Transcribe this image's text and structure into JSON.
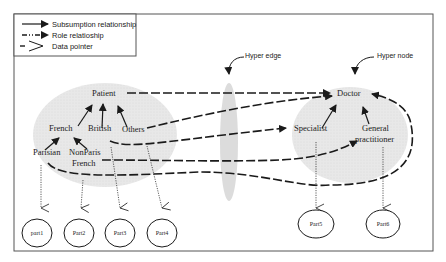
{
  "legend": {
    "items": [
      {
        "label": "Subsumption relationship",
        "style": "solid-arrow"
      },
      {
        "label": "Role relatioship",
        "style": "dash-dot-arrow"
      },
      {
        "label": "Data pointer",
        "style": "open-chevron"
      }
    ]
  },
  "annotations": {
    "hyper_edge": "Hyper edge",
    "hyper_node": "Hyper node"
  },
  "left_hypernode": {
    "root": "Patient",
    "children": [
      "French",
      "British",
      "Others"
    ],
    "grandchildren": [
      "Parisian",
      "NonParis",
      "French"
    ]
  },
  "right_hypernode": {
    "root": "Doctor",
    "children": [
      "Specialist",
      "General",
      "practitioner"
    ]
  },
  "parts": [
    "part1",
    "Part2",
    "Part3",
    "Part4",
    "Part5",
    "Part6"
  ],
  "colors": {
    "shade": "#e6e6e6",
    "line": "#1a1a1a",
    "border": "#555555"
  }
}
